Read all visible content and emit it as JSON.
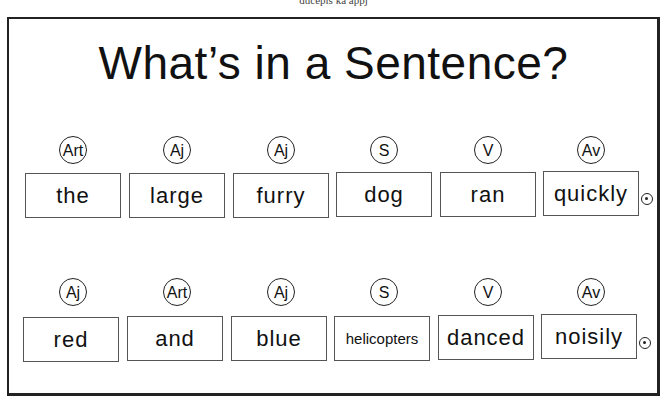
{
  "top_fragment": "ducepis ka appj",
  "title": "What’s in a Sentence?",
  "rows": [
    {
      "tags": [
        "Art",
        "Aj",
        "Aj",
        "S",
        "V",
        "Av"
      ],
      "words": [
        "the",
        "large",
        "furry",
        "dog",
        "ran",
        "quickly"
      ]
    },
    {
      "tags": [
        "Aj",
        "Art",
        "Aj",
        "S",
        "V",
        "Av"
      ],
      "words": [
        "red",
        "and",
        "blue",
        "helicopters",
        "danced",
        "noisily"
      ]
    }
  ],
  "icons": {
    "row_end": "end-dot-icon"
  }
}
